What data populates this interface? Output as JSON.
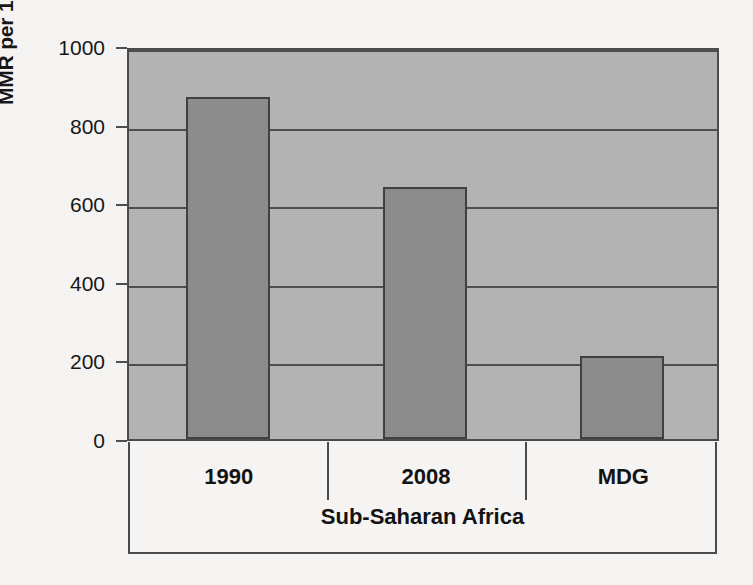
{
  "chart_data": {
    "type": "bar",
    "title": "",
    "subtitle": "",
    "xlabel": "Sub-Saharan Africa",
    "ylabel": "MMR per 100,000 livebirths",
    "categories": [
      "1990",
      "2008",
      "MDG"
    ],
    "values": [
      870,
      640,
      210
    ],
    "series": [
      {
        "name": "MMR per 100,000 livebirths",
        "values": [
          870,
          640,
          210
        ]
      }
    ],
    "ylim": [
      0,
      1000
    ],
    "yticks": [
      0,
      200,
      400,
      600,
      800,
      1000
    ],
    "ytick_labels": [
      "0",
      "200",
      "400",
      "600",
      "800",
      "1000"
    ],
    "grid": true,
    "grid_axis": "y",
    "legend": false,
    "legend_position": "none",
    "annotations": [],
    "colors": {
      "bar_fill": "#8c8c8c",
      "bar_edge": "#3f3f3f",
      "plot_background": "#b4b4b4",
      "gridline": "#4d4d4d",
      "axis_line": "#4a4a4a",
      "text": "#101010",
      "page_background": "#f7f6f4"
    }
  },
  "axes": {
    "y_title": "MMR per 100,000 livebirths",
    "x_title": "Sub-Saharan Africa",
    "y_ticks": [
      {
        "label": "1000",
        "value": 1000
      },
      {
        "label": "800",
        "value": 800
      },
      {
        "label": "600",
        "value": 600
      },
      {
        "label": "400",
        "value": 400
      },
      {
        "label": "200",
        "value": 200
      },
      {
        "label": "0",
        "value": 0
      }
    ]
  },
  "bars": [
    {
      "label": "1990",
      "value": 870
    },
    {
      "label": "2008",
      "value": 640
    },
    {
      "label": "MDG",
      "value": 210
    }
  ]
}
